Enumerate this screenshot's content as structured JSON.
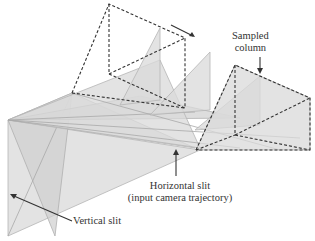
{
  "diagram": {
    "type": "3d-geometric-illustration",
    "colors": {
      "fill": "#d9d9d9",
      "dashed_edges": "#333333",
      "text": "#333333",
      "background": "#ffffff"
    }
  },
  "labels": {
    "sampled_column": {
      "line1": "Sampled",
      "line2": "column"
    },
    "horizontal_slit": {
      "line1": "Horizontal slit",
      "line2": "(input camera trajectory)"
    },
    "vertical_slit": {
      "line1": "Vertical slit"
    }
  }
}
